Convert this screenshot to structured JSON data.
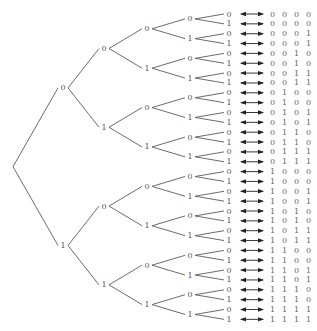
{
  "diagram": {
    "type": "binary-tree",
    "title": "",
    "depth": 5,
    "root_label": "",
    "level_x": [
      13,
      63,
      104,
      147,
      190,
      229
    ],
    "first_row_y": 14,
    "row_spacing": 9.85,
    "arrow": {
      "x1": 241,
      "x2": 263,
      "style": "double-headed"
    },
    "code_x": 270,
    "colors": {
      "edge": "#5a5a5a",
      "node_label": "#555555",
      "arrow": "#222222",
      "code": "#666666",
      "background": "#ffffff"
    },
    "branch_labels": [
      "0",
      "1"
    ],
    "codes": [
      "00000",
      "00001",
      "00010",
      "00011",
      "00100",
      "00101",
      "00110",
      "00111",
      "01000",
      "01001",
      "01010",
      "01011",
      "01100",
      "01101",
      "01110",
      "01111",
      "10000",
      "10001",
      "10010",
      "10011",
      "10100",
      "10101",
      "10110",
      "10111",
      "11000",
      "11001",
      "11010",
      "11011",
      "11100",
      "11101",
      "11110",
      "11111"
    ]
  }
}
